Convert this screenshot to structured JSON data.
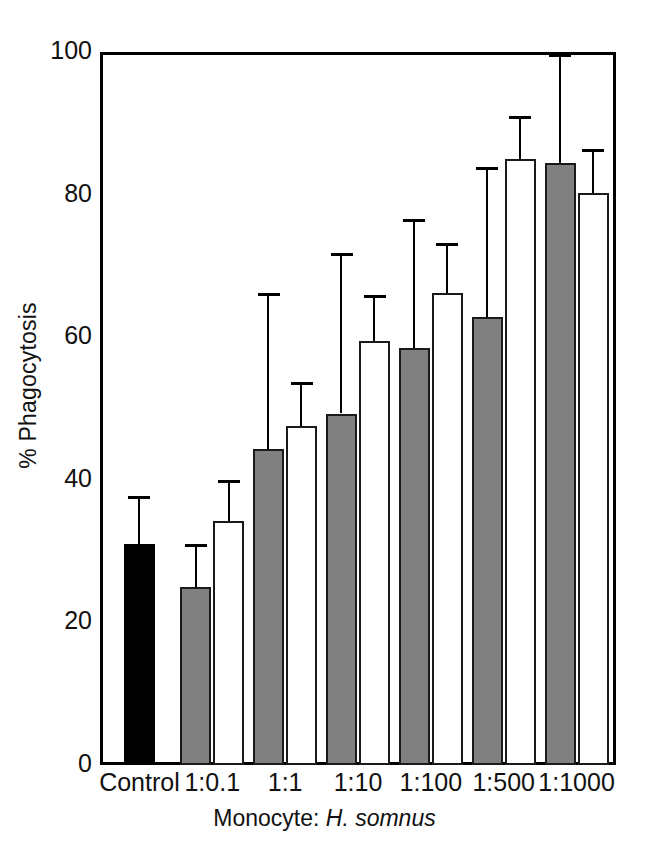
{
  "chart_data": {
    "type": "bar",
    "title": "",
    "xlabel": "Monocyte: H. somnus",
    "xlabel_prefix": "Monocyte: ",
    "xlabel_species": "H. somnus",
    "ylabel": "% Phagocytosis",
    "ylim": [
      0,
      100
    ],
    "yticks": [
      0,
      20,
      40,
      60,
      80,
      100
    ],
    "ytick_labels": [
      "0",
      "20",
      "40",
      "60",
      "80",
      "100"
    ],
    "grid": false,
    "legend": "none",
    "categories": [
      "Control",
      "1:0.1",
      "1:1",
      "1:10",
      "1:100",
      "1:500",
      "1:1000"
    ],
    "series": [
      {
        "name": "Control (solid black)",
        "fill": "#000000",
        "values": [
          31.0,
          null,
          null,
          null,
          null,
          null,
          null
        ],
        "errors_upper": [
          37.5,
          null,
          null,
          null,
          null,
          null,
          null
        ]
      },
      {
        "name": "Gray bars",
        "fill": "#808080",
        "values": [
          null,
          25.0,
          44.3,
          49.3,
          58.5,
          62.8,
          84.5
        ],
        "errors_upper": [
          null,
          30.8,
          66.0,
          71.6,
          76.3,
          83.6,
          99.5
        ]
      },
      {
        "name": "White bars",
        "fill": "#ffffff",
        "values": [
          null,
          34.2,
          47.6,
          59.4,
          66.2,
          85.0,
          80.2
        ],
        "errors_upper": [
          null,
          39.8,
          53.5,
          65.7,
          73.0,
          90.8,
          86.2
        ]
      }
    ]
  },
  "axis": {
    "y_title": "% Phagocytosis",
    "x_title_prefix": "Monocyte: ",
    "x_title_species": "H. somnus"
  }
}
